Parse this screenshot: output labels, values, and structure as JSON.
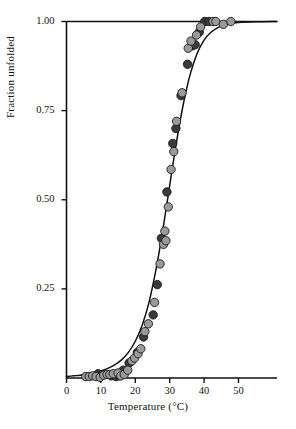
{
  "chart_data": {
    "type": "scatter",
    "title": "",
    "xlabel": "Temperature (°C)",
    "ylabel": "Fraction unfolded",
    "xlim": [
      0,
      61.2
    ],
    "ylim": [
      0.0,
      1.0
    ],
    "xticks": [
      0,
      10,
      20,
      30,
      40,
      50
    ],
    "xtick_labels": [
      "0",
      "10",
      "20",
      "30",
      "40",
      "50"
    ],
    "yticks": [
      0.25,
      0.5,
      0.75,
      1.0
    ],
    "ytick_labels": [
      "0.25",
      "0.50",
      "0.75",
      "1.00"
    ],
    "grid": false,
    "legend": "none",
    "frame": "top-left-bottom",
    "colors": {
      "series_dark": "#3a3a3a",
      "series_light": "#9a9a9a",
      "marker_edge": "#1a1a1a",
      "curve": "#111111",
      "axis": "#111111",
      "background": "#ffffff"
    },
    "marker": {
      "shape": "circle",
      "radius_px": 4.2,
      "edge_width_px": 0.9
    },
    "fit_curve": {
      "model": "two-state sigmoid",
      "midpoint_temperature_C": 30.2,
      "x": [
        0,
        2,
        4,
        6,
        8,
        10,
        12,
        14,
        16,
        18,
        20,
        22,
        24,
        26,
        28,
        30,
        32,
        34,
        36,
        38,
        40,
        42,
        44,
        46,
        48,
        50,
        55,
        61.2
      ],
      "y": [
        0.004,
        0.006,
        0.008,
        0.011,
        0.015,
        0.02,
        0.027,
        0.037,
        0.051,
        0.072,
        0.103,
        0.148,
        0.213,
        0.303,
        0.415,
        0.54,
        0.663,
        0.77,
        0.853,
        0.911,
        0.948,
        0.97,
        0.983,
        0.99,
        0.994,
        0.997,
        0.999,
        1.0
      ]
    },
    "series": [
      {
        "name": "series_dark",
        "color": "#3a3a3a",
        "points": [
          [
            9.2,
            0.012
          ],
          [
            10.1,
            0.008
          ],
          [
            11.0,
            0.01
          ],
          [
            13.0,
            0.006
          ],
          [
            14.4,
            0.004
          ],
          [
            14.9,
            0.012
          ],
          [
            15.4,
            0.006
          ],
          [
            16.2,
            0.01
          ],
          [
            16.5,
            0.022
          ],
          [
            18.2,
            0.042
          ],
          [
            20.6,
            0.072
          ],
          [
            22.4,
            0.115
          ],
          [
            25.2,
            0.177
          ],
          [
            26.4,
            0.262
          ],
          [
            27.6,
            0.392
          ],
          [
            29.2,
            0.522
          ],
          [
            30.9,
            0.658
          ],
          [
            31.8,
            0.7
          ],
          [
            33.3,
            0.792
          ],
          [
            35.2,
            0.88
          ],
          [
            36.6,
            0.932
          ],
          [
            37.4,
            0.935
          ],
          [
            38.6,
            0.97
          ],
          [
            40.2,
            1.0
          ],
          [
            41.4,
            1.0
          ]
        ]
      },
      {
        "name": "series_light",
        "color": "#9a9a9a",
        "points": [
          [
            5.6,
            0.004
          ],
          [
            6.6,
            0.004
          ],
          [
            7.6,
            0.006
          ],
          [
            8.6,
            0.004
          ],
          [
            9.8,
            0.002
          ],
          [
            10.8,
            0.008
          ],
          [
            11.8,
            0.01
          ],
          [
            12.6,
            0.01
          ],
          [
            13.6,
            0.012
          ],
          [
            15.0,
            0.014
          ],
          [
            15.8,
            0.006
          ],
          [
            16.8,
            0.01
          ],
          [
            17.8,
            0.022
          ],
          [
            19.0,
            0.048
          ],
          [
            19.8,
            0.056
          ],
          [
            20.8,
            0.068
          ],
          [
            21.6,
            0.082
          ],
          [
            22.8,
            0.13
          ],
          [
            23.8,
            0.152
          ],
          [
            25.6,
            0.212
          ],
          [
            27.2,
            0.32
          ],
          [
            28.2,
            0.375
          ],
          [
            28.6,
            0.412
          ],
          [
            28.9,
            0.385
          ],
          [
            29.6,
            0.48
          ],
          [
            30.4,
            0.585
          ],
          [
            31.2,
            0.635
          ],
          [
            32.0,
            0.72
          ],
          [
            33.6,
            0.8
          ],
          [
            35.4,
            0.925
          ],
          [
            36.2,
            0.945
          ],
          [
            37.8,
            0.962
          ],
          [
            39.0,
            0.985
          ],
          [
            42.6,
            1.0
          ],
          [
            43.4,
            1.0
          ],
          [
            45.6,
            0.992
          ],
          [
            47.8,
            1.0
          ]
        ]
      }
    ]
  },
  "axes": {
    "x_tick_0": "0",
    "x_tick_1": "10",
    "x_tick_2": "20",
    "x_tick_3": "30",
    "x_tick_4": "40",
    "x_tick_5": "50",
    "y_tick_0": "0.25",
    "y_tick_1": "0.50",
    "y_tick_2": "0.75",
    "y_tick_3": "1.00",
    "x_axis_title": "Temperature (°C)",
    "y_axis_title": "Fraction unfolded"
  }
}
